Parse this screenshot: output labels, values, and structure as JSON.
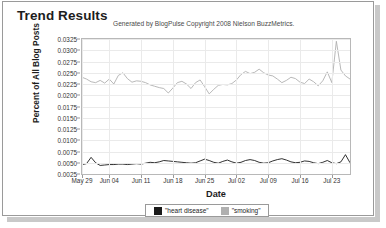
{
  "panel": {
    "title": "Trend Results",
    "subtitle": "Generated by BlogPulse Copyright 2008 Nielson BuzzMetrics."
  },
  "legend": {
    "items": [
      {
        "label": "\"heart disease\"",
        "color": "#1a1a1a"
      },
      {
        "label": "\"smoking\"",
        "color": "#b0b0b0"
      }
    ]
  },
  "chart_data": {
    "type": "line",
    "title": "Trend Results",
    "subtitle": "Generated by BlogPulse Copyright 2008 Nielson BuzzMetrics.",
    "xlabel": "Date",
    "ylabel": "Percent of All Blog Posts",
    "grid": true,
    "legend_position": "bottom",
    "ylim": [
      0.0025,
      0.0325
    ],
    "yticks": [
      0.0025,
      0.005,
      0.0075,
      0.01,
      0.0125,
      0.015,
      0.0175,
      0.02,
      0.0225,
      0.025,
      0.0275,
      0.03,
      0.0325
    ],
    "ytick_labels": [
      "0.0025",
      "0.0050",
      "0.0075",
      "0.0100",
      "0.0125",
      "0.0150",
      "0.0175",
      "0.0200",
      "0.0225",
      "0.0250",
      "0.0275",
      "0.0300",
      "0.0325"
    ],
    "xtick_labels": [
      "May 29",
      "Jun 04",
      "Jun 11",
      "Jun 18",
      "Jun 25",
      "Jul 02",
      "Jul 09",
      "Jul 16",
      "Jul 23"
    ],
    "xtick_indices": [
      0,
      6,
      13,
      20,
      27,
      34,
      41,
      48,
      55
    ],
    "n_points": 60,
    "series": [
      {
        "name": "\"smoking\"",
        "color": "#b0b0b0",
        "values": [
          0.024,
          0.0236,
          0.023,
          0.0228,
          0.0233,
          0.0227,
          0.0236,
          0.0225,
          0.0244,
          0.025,
          0.0237,
          0.0229,
          0.0232,
          0.0231,
          0.0228,
          0.0223,
          0.022,
          0.0217,
          0.0215,
          0.0205,
          0.0216,
          0.0228,
          0.0231,
          0.0225,
          0.0215,
          0.0228,
          0.0234,
          0.0219,
          0.0203,
          0.0213,
          0.0222,
          0.0224,
          0.0223,
          0.0226,
          0.0234,
          0.0246,
          0.0253,
          0.0248,
          0.0251,
          0.0258,
          0.025,
          0.0245,
          0.0243,
          0.0236,
          0.0228,
          0.0233,
          0.024,
          0.0237,
          0.0229,
          0.0226,
          0.0236,
          0.023,
          0.0221,
          0.0232,
          0.0252,
          0.0228,
          0.032,
          0.0256,
          0.0243,
          0.0236
        ],
        "ymin": 0.0203,
        "ymax": 0.032
      },
      {
        "name": "\"heart disease\"",
        "color": "#1a1a1a",
        "values": [
          0.0046,
          0.0048,
          0.0062,
          0.005,
          0.0044,
          0.0045,
          0.0046,
          0.0046,
          0.0047,
          0.0047,
          0.0046,
          0.0047,
          0.0048,
          0.0047,
          0.0049,
          0.0051,
          0.005,
          0.0052,
          0.0055,
          0.0054,
          0.0053,
          0.0052,
          0.0051,
          0.005,
          0.0049,
          0.005,
          0.0054,
          0.0058,
          0.0055,
          0.0051,
          0.0049,
          0.0053,
          0.0056,
          0.0052,
          0.0049,
          0.0051,
          0.0055,
          0.0057,
          0.0055,
          0.0051,
          0.0049,
          0.005,
          0.0054,
          0.0057,
          0.0059,
          0.0056,
          0.0052,
          0.005,
          0.0051,
          0.0054,
          0.0053,
          0.005,
          0.0048,
          0.0051,
          0.0055,
          0.005,
          0.0048,
          0.0052,
          0.0068,
          0.005
        ],
        "ymin": 0.0044,
        "ymax": 0.0068
      }
    ]
  }
}
